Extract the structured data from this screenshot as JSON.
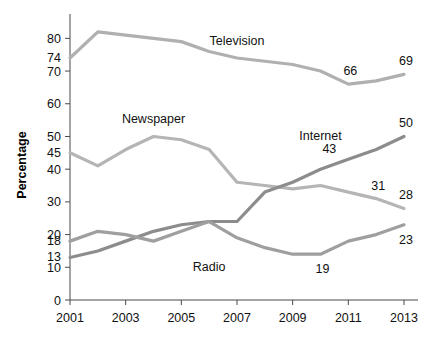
{
  "chart_data": {
    "type": "line",
    "title": "",
    "xlabel": "",
    "ylabel": "Percentage",
    "xlim": [
      2001,
      2013
    ],
    "ylim": [
      0,
      85
    ],
    "grid": false,
    "legend": "inline-labels",
    "x": [
      2001,
      2002,
      2003,
      2004,
      2005,
      2006,
      2007,
      2008,
      2009,
      2010,
      2011,
      2012,
      2013
    ],
    "xticks": [
      "2001",
      "2003",
      "2005",
      "2007",
      "2009",
      "2011",
      "2013"
    ],
    "xtick_values": [
      2001,
      2003,
      2005,
      2007,
      2009,
      2011,
      2013
    ],
    "yticks": [
      "0",
      "10",
      "20",
      "30",
      "40",
      "50",
      "60",
      "70",
      "80"
    ],
    "ytick_values": [
      0,
      10,
      20,
      30,
      40,
      50,
      60,
      70,
      80
    ],
    "series": [
      {
        "name": "Television",
        "color": "#b0b0b0",
        "label_x": 2007,
        "label_y": 78,
        "values": [
          74,
          82,
          81,
          80,
          79,
          76,
          74,
          73,
          72,
          70,
          66,
          67,
          69
        ],
        "point_labels": [
          {
            "x": 2001,
            "y": 74,
            "text": "74",
            "pos": "left"
          },
          {
            "x": 2011,
            "y": 66,
            "text": "66",
            "pos": "above"
          },
          {
            "x": 2013,
            "y": 69,
            "text": "69",
            "pos": "above"
          }
        ]
      },
      {
        "name": "Newspaper",
        "color": "#b5b5b5",
        "label_x": 2004,
        "label_y": 54,
        "values": [
          45,
          41,
          46,
          50,
          49,
          46,
          36,
          35,
          34,
          35,
          33,
          31,
          28
        ],
        "point_labels": [
          {
            "x": 2001,
            "y": 45,
            "text": "45",
            "pos": "left"
          },
          {
            "x": 2012,
            "y": 31,
            "text": "31",
            "pos": "above"
          },
          {
            "x": 2013,
            "y": 28,
            "text": "28",
            "pos": "above"
          }
        ]
      },
      {
        "name": "Internet",
        "color": "#8c8c8c",
        "label_x": 2010,
        "label_y": 49,
        "values": [
          13,
          15,
          18,
          21,
          23,
          24,
          24,
          33,
          36,
          40,
          43,
          46,
          50
        ],
        "point_labels": [
          {
            "x": 2001,
            "y": 13,
            "text": "13",
            "pos": "left"
          },
          {
            "x": 2011,
            "y": 43,
            "text": "43",
            "pos": "left-above"
          },
          {
            "x": 2013,
            "y": 50,
            "text": "50",
            "pos": "above"
          }
        ]
      },
      {
        "name": "Radio",
        "color": "#9f9f9f",
        "label_x": 2006,
        "label_y": 9,
        "values": [
          18,
          21,
          20,
          18,
          21,
          24,
          19,
          16,
          14,
          14,
          18,
          20,
          23
        ],
        "point_labels": [
          {
            "x": 2001,
            "y": 18,
            "text": "18",
            "pos": "left"
          },
          {
            "x": 2010,
            "y": 14,
            "text": "19",
            "pos": "below"
          },
          {
            "x": 2013,
            "y": 23,
            "text": "23",
            "pos": "below"
          }
        ]
      }
    ]
  }
}
